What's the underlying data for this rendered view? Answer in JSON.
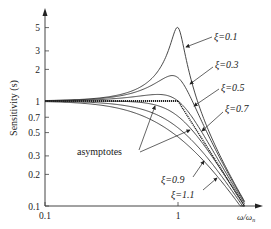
{
  "chart_data": {
    "type": "line",
    "title": "",
    "xlabel": "ω/ωn",
    "ylabel": "Sensitivity (s)",
    "xscale": "log",
    "yscale": "log",
    "xlim": [
      0.1,
      3.2
    ],
    "ylim": [
      0.1,
      7
    ],
    "x_ticks": [
      {
        "value": 0.1,
        "label": "0.1"
      },
      {
        "value": 1,
        "label": "1"
      }
    ],
    "y_ticks": [
      {
        "value": 0.1,
        "label": "0.1"
      },
      {
        "value": 0.2,
        "label": "0.2"
      },
      {
        "value": 0.3,
        "label": "0.3"
      },
      {
        "value": 0.5,
        "label": "0.5"
      },
      {
        "value": 0.7,
        "label": "0.7"
      },
      {
        "value": 1,
        "label": "1"
      },
      {
        "value": 2,
        "label": "2"
      },
      {
        "value": 3,
        "label": "3"
      },
      {
        "value": 5,
        "label": "5"
      }
    ],
    "grid": false,
    "legend": "none (inline annotations)",
    "series": [
      {
        "name": "ξ=0.1",
        "zeta": 0.1,
        "peak": 5.0
      },
      {
        "name": "ξ=0.3",
        "zeta": 0.3,
        "peak": 1.75
      },
      {
        "name": "ξ=0.5",
        "zeta": 0.5,
        "peak": 1.15
      },
      {
        "name": "ξ=0.7",
        "zeta": 0.7,
        "peak": 1.0
      },
      {
        "name": "ξ=0.9",
        "zeta": 0.9,
        "peak": 1.0
      },
      {
        "name": "ξ=1.1",
        "zeta": 1.1,
        "peak": 1.0
      }
    ],
    "asymptotes": {
      "label": "asymptotes",
      "low_freq": "S = 1 for ω/ωn < 1",
      "high_freq": "S = (ω/ωn)^-2 for ω/ωn > 1"
    },
    "annotations": [
      {
        "text": "ξ=0.1"
      },
      {
        "text": "ξ=0.3"
      },
      {
        "text": "ξ=0.5"
      },
      {
        "text": "ξ=0.7"
      },
      {
        "text": "ξ=0.9"
      },
      {
        "text": "ξ=1.1"
      },
      {
        "text": "asymptotes"
      }
    ]
  },
  "labels": {
    "ylabel": "Sensitivity (s)",
    "xlabel_main": "ω/ω",
    "xlabel_sub": "n",
    "x0": "0.1",
    "x1": "1",
    "z01": "ξ=0.1",
    "z03": "ξ=0.3",
    "z05": "ξ=0.5",
    "z07": "ξ=0.7",
    "z09": "ξ=0.9",
    "z11": "ξ=1.1",
    "asym": "asymptotes"
  },
  "colors": {
    "line": "#333333",
    "axis": "#444444",
    "background": "#ffffff"
  }
}
